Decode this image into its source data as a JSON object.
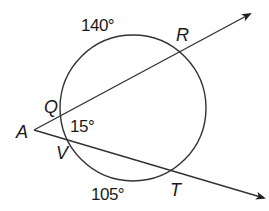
{
  "diagram": {
    "type": "circle-with-two-secants",
    "colors": {
      "stroke": "#333333",
      "text": "#1a1a1a",
      "background": "#ffffff"
    },
    "circle": {
      "cx": 133,
      "cy": 108,
      "r": 73
    },
    "external_point": {
      "name": "A",
      "x": 34,
      "y": 130
    },
    "secants": [
      {
        "name": "secant-AR",
        "from": "A",
        "near_point": "Q",
        "far_point": "R",
        "end": {
          "x": 250,
          "y": 14
        }
      },
      {
        "name": "secant-AT",
        "from": "A",
        "near_point": "V",
        "far_point": "T",
        "end": {
          "x": 264,
          "y": 198
        }
      }
    ],
    "points": {
      "A": {
        "label": "A",
        "x": 34,
        "y": 130
      },
      "Q": {
        "label": "Q",
        "x": 63,
        "y": 117
      },
      "R": {
        "label": "R",
        "x": 180,
        "y": 51
      },
      "V": {
        "label": "V",
        "x": 71,
        "y": 141
      },
      "T": {
        "label": "T",
        "x": 176,
        "y": 178
      }
    },
    "labels": {
      "arc_QR": "140°",
      "arc_VT": "105°",
      "angle_A": "15°",
      "point_A": "A",
      "point_Q": "Q",
      "point_R": "R",
      "point_V": "V",
      "point_T": "T"
    },
    "measures": {
      "arc_QR_degrees": 140,
      "arc_VT_degrees": 105,
      "angle_A_degrees": 15
    }
  }
}
